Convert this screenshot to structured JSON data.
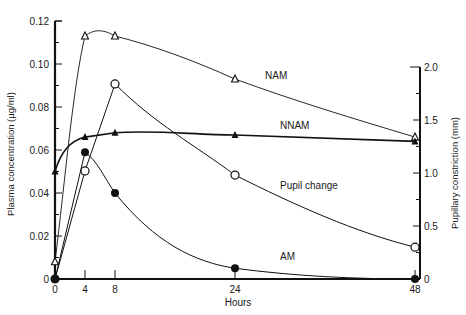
{
  "chart_data": {
    "type": "line",
    "title": "",
    "xlabel": "Hours",
    "ylabel": "Plasma concentration (µg/ml)",
    "y2label": "Pupillary constriction (mm)",
    "xlim": [
      0,
      48
    ],
    "ylim": [
      0,
      0.12
    ],
    "y2lim": [
      0,
      2.0
    ],
    "x_ticks": [
      0,
      4,
      8,
      24,
      48
    ],
    "x_tick_labels": [
      "0",
      "4",
      "8",
      "24",
      "48"
    ],
    "y_ticks": [
      0,
      0.02,
      0.04,
      0.06,
      0.08,
      0.1,
      0.12
    ],
    "y_tick_labels": [
      "0",
      "0.02",
      "0.04",
      "0.06",
      "0.08",
      "0.10",
      "0.12"
    ],
    "y2_ticks": [
      0,
      0.5,
      1.0,
      1.5,
      2.0
    ],
    "y2_tick_labels": [
      "0",
      "0.5",
      "1.0",
      "1.5",
      "2.0"
    ],
    "grid": false,
    "legend_position": "inline labels",
    "series": [
      {
        "name": "NAM",
        "marker": "open-triangle",
        "axis": "left",
        "x": [
          0,
          4,
          8,
          24,
          48
        ],
        "values": [
          0.008,
          0.113,
          0.113,
          0.093,
          0.066
        ]
      },
      {
        "name": "NNAM",
        "marker": "filled-triangle",
        "axis": "left",
        "x": [
          0,
          4,
          8,
          24,
          48
        ],
        "values": [
          0.05,
          0.066,
          0.068,
          0.067,
          0.064
        ]
      },
      {
        "name": "Pupil change",
        "marker": "open-circle",
        "axis": "right",
        "x": [
          0,
          4,
          8,
          24,
          48
        ],
        "values": [
          0,
          1.02,
          1.84,
          0.98,
          0.3
        ]
      },
      {
        "name": "AM",
        "marker": "filled-circle",
        "axis": "left",
        "x": [
          0,
          4,
          8,
          24,
          48
        ],
        "values": [
          0,
          0.059,
          0.04,
          0.005,
          0
        ]
      }
    ],
    "annotations": [
      {
        "text": "NAM",
        "x": 28,
        "y": 0.093
      },
      {
        "text": "NNAM",
        "x": 30,
        "y": 0.07
      },
      {
        "text": "Pupil change",
        "x": 30,
        "y": 0.042
      },
      {
        "text": "AM",
        "x": 30,
        "y": 0.009
      }
    ]
  }
}
